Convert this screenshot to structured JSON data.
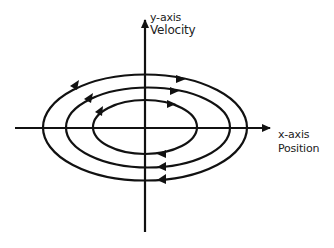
{
  "diagram": {
    "y_axis": {
      "label_line1": "y-axis",
      "label_line2": "Velocity"
    },
    "x_axis": {
      "label_line1": "x-axis",
      "label_line2": "Position"
    },
    "orbits": [
      {
        "name": "inner",
        "cx": 145,
        "cy": 127,
        "rx": 52,
        "ry": 27
      },
      {
        "name": "middle",
        "cx": 148,
        "cy": 127,
        "rx": 82,
        "ry": 40
      },
      {
        "name": "outer",
        "cx": 145,
        "cy": 127,
        "rx": 102,
        "ry": 53
      }
    ],
    "direction": "clockwise",
    "stroke_color": "#111111"
  }
}
